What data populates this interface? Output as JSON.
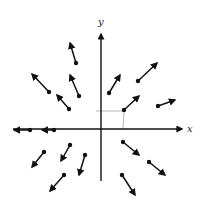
{
  "diagram": {
    "type": "vector-field",
    "axes": {
      "x_label": "x",
      "y_label": "y",
      "origin": [
        101,
        129
      ],
      "x_range_px": [
        13,
        184
      ],
      "y_range_px": [
        33,
        181
      ]
    },
    "guide_point": [
      124,
      111
    ],
    "colors": {
      "stroke": "#111111",
      "guide": "#999999",
      "background": "#ffffff"
    },
    "vectors": [
      {
        "from": [
          76,
          63
        ],
        "to": [
          70,
          43
        ]
      },
      {
        "from": [
          49,
          92
        ],
        "to": [
          32,
          74
        ]
      },
      {
        "from": [
          79,
          96
        ],
        "to": [
          70,
          75
        ]
      },
      {
        "from": [
          69,
          109
        ],
        "to": [
          57,
          95
        ]
      },
      {
        "from": [
          109,
          93
        ],
        "to": [
          120,
          75
        ]
      },
      {
        "from": [
          138,
          81
        ],
        "to": [
          157,
          63
        ]
      },
      {
        "from": [
          124,
          110
        ],
        "to": [
          139,
          96
        ]
      },
      {
        "from": [
          158,
          106
        ],
        "to": [
          175,
          100
        ]
      },
      {
        "from": [
          30,
          130
        ],
        "to": [
          14,
          130
        ]
      },
      {
        "from": [
          54,
          130
        ],
        "to": [
          42,
          130
        ]
      },
      {
        "from": [
          44,
          152
        ],
        "to": [
          32,
          167
        ]
      },
      {
        "from": [
          70,
          145
        ],
        "to": [
          61,
          161
        ]
      },
      {
        "from": [
          85,
          155
        ],
        "to": [
          79,
          175
        ]
      },
      {
        "from": [
          64,
          175
        ],
        "to": [
          50,
          191
        ]
      },
      {
        "from": [
          123,
          142
        ],
        "to": [
          139,
          155
        ]
      },
      {
        "from": [
          149,
          162
        ],
        "to": [
          165,
          175
        ]
      },
      {
        "from": [
          122,
          175
        ],
        "to": [
          135,
          195
        ]
      }
    ]
  }
}
